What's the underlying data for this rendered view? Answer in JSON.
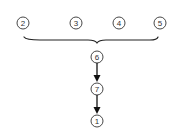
{
  "diagram": {
    "type": "flow-diagram",
    "colors": {
      "stroke": "#333333",
      "background": "#ffffff"
    },
    "top_row": [
      {
        "id": "2",
        "label": "2",
        "cx": 23,
        "cy": 23
      },
      {
        "id": "3",
        "label": "3",
        "cx": 76,
        "cy": 23
      },
      {
        "id": "4",
        "label": "4",
        "cx": 119,
        "cy": 23
      },
      {
        "id": "5",
        "label": "5",
        "cx": 160,
        "cy": 23
      }
    ],
    "brace": {
      "from_x": 24,
      "to_x": 158,
      "y": 38,
      "tip_x": 97,
      "tip_y": 43,
      "groups": [
        "2",
        "3",
        "4",
        "5"
      ],
      "into": "6"
    },
    "chain": [
      {
        "id": "6",
        "label": "6",
        "cx": 97,
        "cy": 57
      },
      {
        "id": "7",
        "label": "7",
        "cx": 97,
        "cy": 89
      },
      {
        "id": "1",
        "label": "1",
        "cx": 97,
        "cy": 121
      }
    ],
    "edges": [
      {
        "from": "6",
        "to": "7"
      },
      {
        "from": "7",
        "to": "1"
      }
    ]
  }
}
